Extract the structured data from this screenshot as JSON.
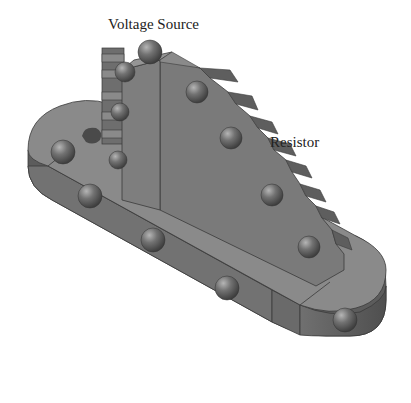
{
  "diagram": {
    "type": "3d-physical-model",
    "labels": {
      "voltage_source": "Voltage Source",
      "resistor": "Resistor"
    },
    "colors": {
      "base_top": "#8a8a8a",
      "base_side": "#6e6e6e",
      "base_side_dark": "#5a5a5a",
      "tower_front": "#7c7c7c",
      "tower_side": "#6a6a6a",
      "step_top": "#8c8c8c",
      "step_riser": "#5e5e5e",
      "ball": "#6a6a6a",
      "edge": "#3a3a3a"
    },
    "ball_count": 13
  }
}
